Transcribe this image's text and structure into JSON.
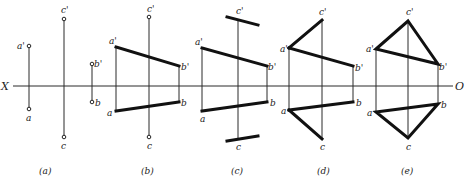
{
  "axis": {
    "left_label": "X",
    "right_label": "O",
    "y": 86,
    "x_start": 8,
    "x_end": 453
  },
  "figures": [
    {
      "caption": "(a)",
      "caption_x": 46,
      "points": {
        "a_prime": {
          "label": "a'",
          "x": 29,
          "y": 46
        },
        "a": {
          "label": "a",
          "x": 29,
          "y": 109
        },
        "c_prime": {
          "label": "c'",
          "x": 64,
          "y": 19
        },
        "c": {
          "label": "c",
          "x": 64,
          "y": 137
        },
        "b_prime": {
          "label": "b'",
          "x": 92,
          "y": 64
        },
        "b": {
          "label": "b",
          "x": 92,
          "y": 102
        }
      }
    },
    {
      "caption": "(b)",
      "caption_x": 148,
      "points": {
        "a_prime": {
          "label": "a'",
          "x": 116,
          "y": 47
        },
        "b_prime": {
          "label": "b'",
          "x": 179,
          "y": 66
        },
        "a": {
          "label": "a",
          "x": 116,
          "y": 111
        },
        "b": {
          "label": "b",
          "x": 179,
          "y": 102
        },
        "c_prime": {
          "label": "c'",
          "x": 149,
          "y": 17
        },
        "c": {
          "label": "c",
          "x": 149,
          "y": 137
        }
      }
    },
    {
      "caption": "(c)",
      "caption_x": 238,
      "points": {
        "a_prime": {
          "label": "a'",
          "x": 202,
          "y": 48
        },
        "b_prime": {
          "label": "b'",
          "x": 267,
          "y": 66
        },
        "a": {
          "label": "a",
          "x": 202,
          "y": 111
        },
        "b": {
          "label": "b",
          "x": 267,
          "y": 102
        },
        "c_prime": {
          "label": "c'",
          "x": 238,
          "y": 20
        },
        "c": {
          "label": "c",
          "x": 238,
          "y": 139
        }
      }
    },
    {
      "caption": "(d)",
      "caption_x": 324,
      "points": {
        "a_prime": {
          "label": "a'",
          "x": 289,
          "y": 48
        },
        "c_prime": {
          "label": "c'",
          "x": 322,
          "y": 20
        },
        "b_prime": {
          "label": "b'",
          "x": 353,
          "y": 66
        },
        "a": {
          "label": "a",
          "x": 289,
          "y": 110
        },
        "b": {
          "label": "b",
          "x": 353,
          "y": 102
        },
        "c": {
          "label": "c",
          "x": 322,
          "y": 139
        }
      }
    },
    {
      "caption": "(e)",
      "caption_x": 408,
      "points": {
        "a_prime": {
          "label": "a'",
          "x": 376,
          "y": 49
        },
        "c_prime": {
          "label": "c'",
          "x": 408,
          "y": 21
        },
        "b_prime": {
          "label": "b'",
          "x": 438,
          "y": 64
        },
        "a": {
          "label": "a",
          "x": 376,
          "y": 112
        },
        "b": {
          "label": "b",
          "x": 438,
          "y": 104
        },
        "c": {
          "label": "c",
          "x": 408,
          "y": 138
        }
      }
    }
  ],
  "colors": {
    "line": "#111111",
    "background": "#ffffff"
  }
}
